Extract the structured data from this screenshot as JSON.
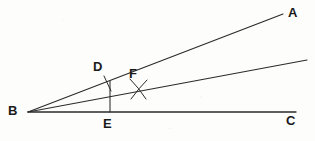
{
  "figure": {
    "kind": "geometry-diagram",
    "background_color": "#fdfdfc",
    "stroke_color": "#2b2b2b",
    "label_color": "#1a1a1a",
    "width": 315,
    "height": 141
  },
  "points": [
    {
      "id": "B",
      "label": "B",
      "label_x": 8,
      "label_y": 104,
      "x": 28,
      "y": 112,
      "role": "vertex"
    },
    {
      "id": "A",
      "label": "A",
      "label_x": 288,
      "label_y": 7,
      "x": 283,
      "y": 14,
      "role": "ray-endpoint"
    },
    {
      "id": "C",
      "label": "C",
      "label_x": 286,
      "label_y": 114,
      "x": 296,
      "y": 112,
      "role": "ray-endpoint"
    },
    {
      "id": "D",
      "label": "D",
      "label_x": 93,
      "label_y": 60,
      "x": 110,
      "y": 81,
      "role": "point-on-ray-BA"
    },
    {
      "id": "E",
      "label": "E",
      "label_x": 103,
      "label_y": 117,
      "x": 110,
      "y": 112,
      "role": "foot-on-base-BC"
    },
    {
      "id": "F",
      "label": "F",
      "label_x": 129,
      "label_y": 67,
      "x": 138,
      "y": 88,
      "role": "arc-intersection"
    }
  ],
  "segments": [
    {
      "id": "BA",
      "from": "B",
      "to": "A",
      "x1": 28,
      "y1": 112,
      "x2": 283,
      "y2": 14,
      "name": "ray-ba"
    },
    {
      "id": "BM",
      "from": "B",
      "to": "middle",
      "x1": 28,
      "y1": 112,
      "x2": 307,
      "y2": 60,
      "name": "ray-bisector"
    },
    {
      "id": "BC",
      "from": "B",
      "to": "C",
      "x1": 28,
      "y1": 112,
      "x2": 296,
      "y2": 112,
      "name": "ray-bc"
    },
    {
      "id": "DE",
      "from": "D",
      "to": "E",
      "x1": 110,
      "y1": 81,
      "x2": 110,
      "y2": 112,
      "name": "perpendicular-de"
    },
    {
      "id": "Dtick",
      "from": "D",
      "to": "tick",
      "x1": 104,
      "y1": 76,
      "x2": 111,
      "y2": 91,
      "name": "tick-mark-d"
    }
  ],
  "arcs": [
    {
      "id": "arc1",
      "name": "construction-arc-1",
      "d": "M 130 79 Q 139 88 146 99"
    },
    {
      "id": "arc2",
      "name": "construction-arc-2",
      "d": "M 147 80 Q 139 88 131 99"
    }
  ],
  "labels": {
    "a": "A",
    "b": "B",
    "c": "C",
    "d": "D",
    "e": "E",
    "f": "F"
  }
}
